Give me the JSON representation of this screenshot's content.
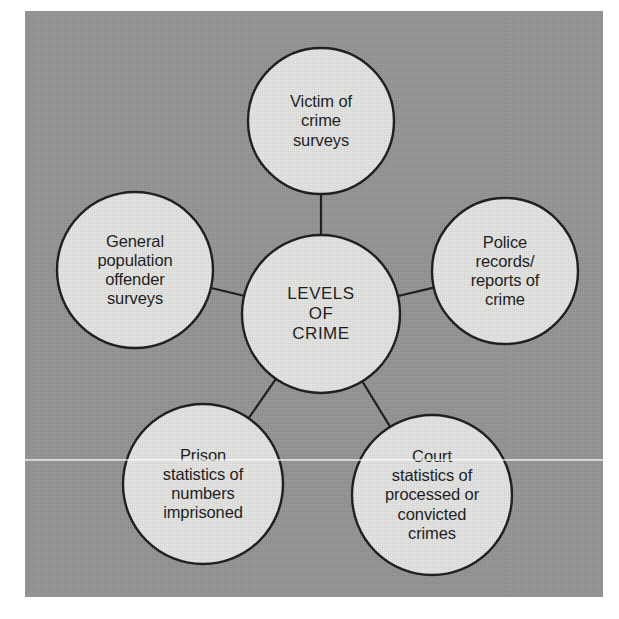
{
  "figure": {
    "type": "spider-diagram",
    "panel_color": "#949494",
    "node_fill": "#e4e4e2",
    "node_stroke": "#1a1a1a",
    "connector_color": "#1a1a1a",
    "text_color": "#18181a"
  },
  "center": {
    "id": "levels-of-crime",
    "label": "LEVELS\nOF\nCRIME",
    "lines": [
      "LEVELS",
      "OF",
      "CRIME"
    ],
    "cx": 321,
    "cy": 314,
    "r": 79
  },
  "satellites": [
    {
      "id": "victim-of-crime-surveys",
      "label": "Victim of\ncrime\nsurveys",
      "lines": [
        "Victim of",
        "crime",
        "surveys"
      ],
      "position": "top",
      "cx": 321,
      "cy": 121,
      "r": 73
    },
    {
      "id": "police-records-reports-of-crime",
      "label": "Police\nrecords/\nreports of\ncrime",
      "lines": [
        "Police",
        "records/",
        "reports of",
        "crime"
      ],
      "position": "right",
      "cx": 505,
      "cy": 271,
      "r": 73
    },
    {
      "id": "general-population-offender-surveys",
      "label": "General\npopulation\noffender\nsurveys",
      "lines": [
        "General",
        "population",
        "offender",
        "surveys"
      ],
      "position": "left",
      "cx": 135,
      "cy": 270,
      "r": 78
    },
    {
      "id": "prison-statistics-of-numbers-imprisoned",
      "label": "Prison\nstatistics of\nnumbers\nimprisoned",
      "lines": [
        "Prison",
        "statistics of",
        "numbers",
        "imprisoned"
      ],
      "position": "bottom-left",
      "cx": 203,
      "cy": 484,
      "r": 80
    },
    {
      "id": "court-statistics-of-processed-or-convicted-crimes",
      "label": "Court\nstatistics of\nprocessed or\nconvicted\ncrimes",
      "lines": [
        "Court",
        "statistics of",
        "processed or",
        "convicted",
        "crimes"
      ],
      "position": "bottom-right",
      "cx": 432,
      "cy": 495,
      "r": 80
    }
  ],
  "connectors": [
    {
      "id": "center-to-victim-of-crime-surveys",
      "from": "levels-of-crime",
      "to": "victim-of-crime-surveys"
    },
    {
      "id": "center-to-police-records-reports-of-crime",
      "from": "levels-of-crime",
      "to": "police-records-reports-of-crime"
    },
    {
      "id": "center-to-general-population-offender-surveys",
      "from": "levels-of-crime",
      "to": "general-population-offender-surveys"
    },
    {
      "id": "center-to-prison-statistics-of-numbers-imprisoned",
      "from": "levels-of-crime",
      "to": "prison-statistics-of-numbers-imprisoned"
    },
    {
      "id": "center-to-court-statistics-of-processed-or-convicted-crimes",
      "from": "levels-of-crime",
      "to": "court-statistics-of-processed-or-convicted-crimes"
    }
  ]
}
